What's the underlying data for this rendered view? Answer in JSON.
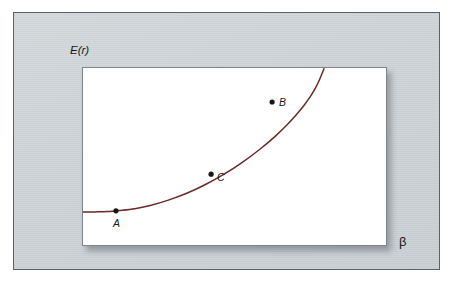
{
  "figure": {
    "background_color": "#ffffff",
    "panel_color": "#ccd2d6",
    "panel_border_color": "#5a6268",
    "plot_background": "#ffffff",
    "plot_border_color": "#7d858b"
  },
  "axes": {
    "y_label": "E(r)",
    "x_label": "β",
    "x_label_icon": "beta-symbol",
    "ticks": [],
    "gridlines": false
  },
  "chart_data": {
    "type": "line",
    "title": "",
    "subtitle": "",
    "xlabel": "β",
    "ylabel": "E(r)",
    "xlim": [
      0,
      1
    ],
    "ylim": [
      0,
      1
    ],
    "grid": false,
    "legend": false,
    "axis_ticks_shown": false,
    "curve_color": "#6b2a24",
    "curve_width": 1.5,
    "series": [
      {
        "name": "E(r) vs beta",
        "color": "#6b2a24",
        "points": [
          {
            "x": 0.0,
            "y": 0.195
          },
          {
            "x": 0.04,
            "y": 0.196
          },
          {
            "x": 0.08,
            "y": 0.198
          },
          {
            "x": 0.12,
            "y": 0.204
          },
          {
            "x": 0.17,
            "y": 0.214
          },
          {
            "x": 0.22,
            "y": 0.232
          },
          {
            "x": 0.28,
            "y": 0.262
          },
          {
            "x": 0.34,
            "y": 0.3
          },
          {
            "x": 0.4,
            "y": 0.348
          },
          {
            "x": 0.46,
            "y": 0.404
          },
          {
            "x": 0.52,
            "y": 0.47
          },
          {
            "x": 0.58,
            "y": 0.546
          },
          {
            "x": 0.63,
            "y": 0.618
          },
          {
            "x": 0.67,
            "y": 0.684
          },
          {
            "x": 0.7,
            "y": 0.74
          },
          {
            "x": 0.725,
            "y": 0.792
          },
          {
            "x": 0.745,
            "y": 0.84
          },
          {
            "x": 0.76,
            "y": 0.882
          },
          {
            "x": 0.772,
            "y": 0.922
          },
          {
            "x": 0.782,
            "y": 0.962
          },
          {
            "x": 0.79,
            "y": 0.996
          }
        ]
      }
    ],
    "annotated_points": [
      {
        "id": "A",
        "label": "A",
        "x": 0.108,
        "y": 0.202,
        "label_position": "below",
        "marker": "filled-circle"
      },
      {
        "id": "B",
        "label": "B",
        "x": 0.62,
        "y": 0.81,
        "label_position": "right",
        "marker": "filled-circle"
      },
      {
        "id": "C",
        "label": "C",
        "x": 0.42,
        "y": 0.407,
        "label_position": "right",
        "marker": "filled-circle"
      }
    ]
  },
  "markers": {
    "A": {
      "label": "A"
    },
    "B": {
      "label": "B"
    },
    "C": {
      "label": "C"
    }
  }
}
